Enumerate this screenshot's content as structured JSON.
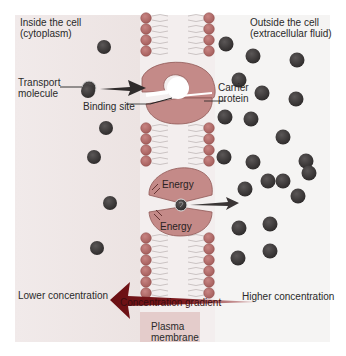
{
  "labels": {
    "inside": [
      "Inside the cell",
      "(cytoplasm)"
    ],
    "outside": [
      "Outside the cell",
      "(extracellular fluid)"
    ],
    "transport_molecule": [
      "Transport",
      "molecule"
    ],
    "binding_site": "Binding site",
    "carrier_protein": [
      "Carrier",
      "protein"
    ],
    "energy_top": "Energy",
    "energy_bottom": "Energy",
    "lower_concentration": "Lower concentration",
    "higher_concentration": "Higher concentration",
    "concentration_gradient": "Concentration gradient",
    "plasma_membrane": [
      "Plasma",
      "membrane"
    ]
  },
  "colors": {
    "background_left": "#efe7e6",
    "background_right": "#f6f5f4",
    "lipid_head": "#b46d6b",
    "lipid_head_stroke": "#8e4a48",
    "protein": "#c48a88",
    "protein_stroke": "#8f5856",
    "molecule": "#3e3b3b",
    "arrow": "#3a3535",
    "gradient_arrow": "#7a1418",
    "membrane_band": "#e2c9c8"
  },
  "molecules_inside": [
    [
      104,
      47
    ],
    [
      88,
      91
    ],
    [
      106,
      128
    ],
    [
      94,
      157
    ],
    [
      110,
      203
    ],
    [
      97,
      248
    ]
  ],
  "molecules_outside": [
    [
      226,
      44
    ],
    [
      253,
      56
    ],
    [
      297,
      60
    ],
    [
      239,
      80
    ],
    [
      262,
      93
    ],
    [
      296,
      99
    ],
    [
      225,
      117
    ],
    [
      251,
      119
    ],
    [
      283,
      137
    ],
    [
      224,
      157
    ],
    [
      253,
      162
    ],
    [
      306,
      161
    ],
    [
      283,
      181
    ],
    [
      309,
      173
    ],
    [
      245,
      189
    ],
    [
      268,
      181
    ],
    [
      298,
      196
    ],
    [
      239,
      228
    ],
    [
      270,
      224
    ],
    [
      238,
      258
    ],
    [
      270,
      251
    ]
  ]
}
